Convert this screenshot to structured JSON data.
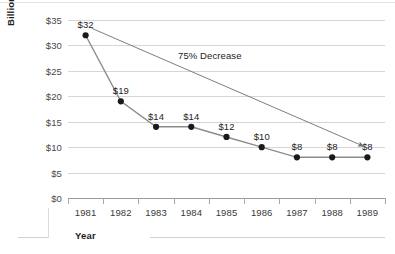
{
  "chart_data": {
    "type": "line",
    "title": "",
    "xlabel": "Year",
    "ylabel": "Billions Spent on Housing Assistance",
    "categories": [
      "1981",
      "1982",
      "1983",
      "1984",
      "1985",
      "1986",
      "1987",
      "1988",
      "1989"
    ],
    "values": [
      32,
      19,
      14,
      14,
      12,
      10,
      8,
      8,
      8
    ],
    "point_labels": [
      "$32",
      "$19",
      "$14",
      "$14",
      "$12",
      "$10",
      "$8",
      "$8",
      "$8"
    ],
    "ylim": [
      0,
      35
    ],
    "ytick_values": [
      0,
      5,
      10,
      15,
      20,
      25,
      30,
      35
    ],
    "ytick_labels": [
      "$0",
      "$5",
      "$10",
      "$15",
      "$20",
      "$25",
      "$30",
      "$35"
    ],
    "grid": true,
    "legend": false,
    "legend_position": "none",
    "annotations": [
      {
        "text": "75% Decrease",
        "kind": "arrow",
        "from_point": "1981",
        "to_point": "1989"
      }
    ],
    "colors": {
      "line": "#8c8c8c",
      "marker": "#1a1a1a",
      "grid": "#d6d6d6",
      "axis": "#9a9a9a",
      "text": "#1d1d1d",
      "annotation": "#6f6f6f",
      "background": "#ffffff"
    }
  }
}
